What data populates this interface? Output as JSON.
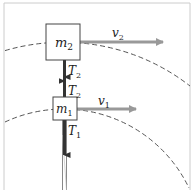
{
  "diagram": {
    "type": "circular-motion-two-masses",
    "masses": [
      {
        "id": "m2",
        "label": "m",
        "subscript": "2"
      },
      {
        "id": "m1",
        "label": "m",
        "subscript": "1"
      }
    ],
    "velocities": [
      {
        "id": "v2",
        "label": "v",
        "subscript": "2"
      },
      {
        "id": "v1",
        "label": "v",
        "subscript": "1"
      }
    ],
    "tensions": [
      {
        "id": "T2_down",
        "label": "T",
        "subscript": "2"
      },
      {
        "id": "T2_up",
        "label": "T",
        "subscript": "2"
      },
      {
        "id": "T1",
        "label": "T",
        "subscript": "1"
      }
    ],
    "colors": {
      "frame": "#cccccc",
      "box_stroke": "#444444",
      "velocity_arrow": "#999999",
      "tension_arrow": "#333333",
      "dashed_path": "#555555",
      "rope": "#888888"
    }
  }
}
